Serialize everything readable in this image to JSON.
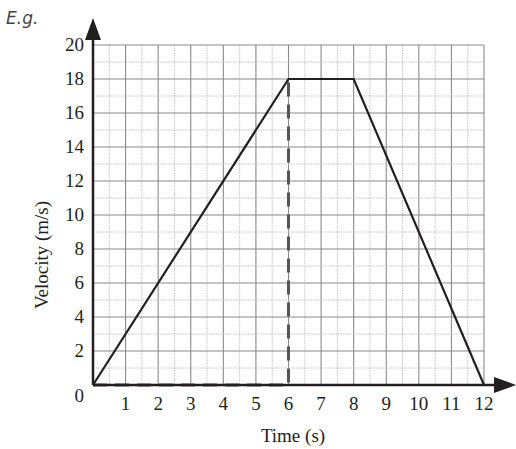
{
  "header": {
    "label": "E.g."
  },
  "chart_data": {
    "type": "line",
    "title": "",
    "xlabel": "Time (s)",
    "ylabel": "Velocity (m/s)",
    "xlim": [
      0,
      12
    ],
    "ylim": [
      0,
      20
    ],
    "x_ticks": [
      "1",
      "2",
      "3",
      "4",
      "5",
      "6",
      "7",
      "8",
      "9",
      "10",
      "11",
      "12"
    ],
    "y_ticks": [
      "2",
      "4",
      "6",
      "8",
      "10",
      "12",
      "14",
      "16",
      "18",
      "20"
    ],
    "origin_label": "0",
    "grid": true,
    "grid_minor": {
      "x_step": 0.5,
      "y_step": 1
    },
    "series": [
      {
        "name": "velocity",
        "x": [
          0,
          6,
          8,
          12
        ],
        "y": [
          0,
          18,
          18,
          0
        ],
        "style": "solid",
        "color": "#231f20"
      }
    ],
    "annotations": [
      {
        "type": "dashed-line",
        "points": [
          [
            0,
            0
          ],
          [
            6,
            0
          ],
          [
            6,
            18
          ]
        ],
        "color": "#555555",
        "description": "area-under-graph guide to t=6"
      }
    ]
  }
}
